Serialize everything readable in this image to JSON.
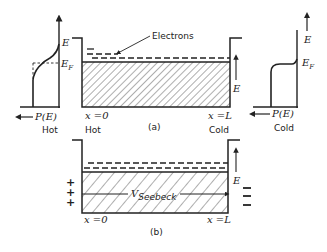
{
  "figure": {
    "panel_a": {
      "label": "(a)",
      "electrons_label": "Electrons",
      "left_position": "x =0",
      "right_position": "x =L",
      "left_side": "Hot",
      "right_side": "Cold",
      "energy_axis": "E"
    },
    "hot_distribution": {
      "energy_axis": "E",
      "fermi_level": "E",
      "fermi_sub": "F",
      "x_axis": "P(E)",
      "caption": "Hot"
    },
    "cold_distribution": {
      "energy_axis": "E",
      "fermi_level": "E",
      "fermi_sub": "F",
      "x_axis": "P(E)",
      "caption": "Cold"
    },
    "panel_b": {
      "label": "(b)",
      "voltage_label": "V",
      "voltage_sub": "Seebeck",
      "left_position": "x =0",
      "right_position": "x =L",
      "energy_axis": "E",
      "left_charge": "+",
      "right_charge": "−"
    }
  }
}
